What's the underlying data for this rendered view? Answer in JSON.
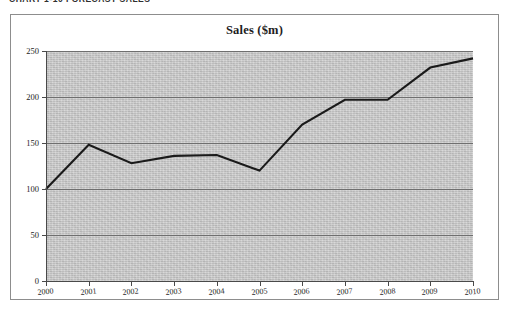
{
  "caption": "CHART 1-10  FORECAST SALES",
  "chart": {
    "title": "Sales ($m)"
  },
  "chart_data": {
    "type": "line",
    "title": "Sales ($m)",
    "xlabel": "",
    "ylabel": "",
    "grid": true,
    "legend": "none",
    "xlim": [
      2000,
      2010
    ],
    "ylim": [
      0,
      250
    ],
    "yticks": [
      0,
      50,
      100,
      150,
      200,
      250
    ],
    "categories": [
      "2000",
      "2001",
      "2002",
      "2003",
      "2004",
      "2005",
      "2006",
      "2007",
      "2008",
      "2009",
      "2010"
    ],
    "values": [
      100,
      148,
      128,
      136,
      137,
      120,
      170,
      197,
      197,
      232,
      242
    ],
    "series": [
      {
        "name": "Sales",
        "color": "#1a1a1a",
        "values": [
          100,
          148,
          128,
          136,
          137,
          120,
          170,
          197,
          197,
          232,
          242
        ]
      }
    ]
  },
  "colors": {
    "plot_fill": "#c9c9c9",
    "gridline": "#6f6f6f",
    "axis": "#4a4a4a",
    "line": "#1a1a1a",
    "frame": "#8d8d8d"
  }
}
